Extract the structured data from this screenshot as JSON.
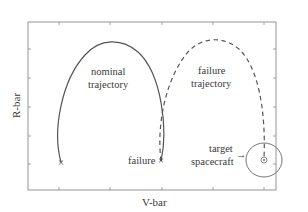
{
  "diagram": {
    "axes": {
      "x_label": "V-bar",
      "y_label": "R-bar"
    },
    "labels": {
      "nominal_line1": "nominal",
      "nominal_line2": "trajectory",
      "failure_traj_line1": "failure",
      "failure_traj_line2": "trajectory",
      "failure_point": "failure",
      "target_line1": "target",
      "target_line2": "spacecraft",
      "target_arrow": "→"
    },
    "markers": {
      "start": "×",
      "failure": "×"
    },
    "colors": {
      "line": "#555555",
      "frame": "#888888",
      "text": "#3a3a3a"
    },
    "trajectories": [
      {
        "name": "nominal trajectory",
        "style": "solid"
      },
      {
        "name": "failure trajectory",
        "style": "dashed"
      }
    ]
  }
}
